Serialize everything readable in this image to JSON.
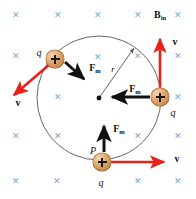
{
  "figure": {
    "field_label": "B",
    "field_subscript": "in",
    "radius_label": "r",
    "point_label": "P",
    "charge_label": "q",
    "force_label": "F",
    "force_subscript": "m",
    "velocity_label": "v",
    "colors": {
      "field_x": "#7ba7d7",
      "velocity_arrow": "#e8211a",
      "force_arrow": "#111111",
      "circle_stroke": "#555555",
      "radius_stroke": "#555555",
      "charge_fill": "#d79c62",
      "background": "#ffffff"
    }
  },
  "geometry": {
    "circle": {
      "cx": 99,
      "cy": 98,
      "r": 62
    },
    "center_dot": {
      "x": 99,
      "y": 98,
      "r": 2.4
    }
  },
  "field_marks": [
    {
      "x": 16,
      "y": 15
    },
    {
      "x": 58,
      "y": 15
    },
    {
      "x": 98,
      "y": 15
    },
    {
      "x": 138,
      "y": 15
    },
    {
      "x": 178,
      "y": 15
    },
    {
      "x": 16,
      "y": 56
    },
    {
      "x": 98,
      "y": 57
    },
    {
      "x": 138,
      "y": 56
    },
    {
      "x": 178,
      "y": 56
    },
    {
      "x": 58,
      "y": 97
    },
    {
      "x": 178,
      "y": 97
    },
    {
      "x": 16,
      "y": 136
    },
    {
      "x": 58,
      "y": 136
    },
    {
      "x": 138,
      "y": 136
    },
    {
      "x": 178,
      "y": 136
    },
    {
      "x": 16,
      "y": 181
    },
    {
      "x": 57,
      "y": 181
    },
    {
      "x": 138,
      "y": 181
    },
    {
      "x": 178,
      "y": 181
    }
  ],
  "charges": [
    {
      "id": "charge-top-left",
      "x": 55,
      "y": 59
    },
    {
      "id": "charge-right",
      "x": 160,
      "y": 97
    },
    {
      "id": "charge-bottom",
      "x": 102,
      "y": 162
    }
  ],
  "arrows": {
    "velocity": [
      {
        "id": "velocity-top-left",
        "x1": 50,
        "y1": 64,
        "x2": 12,
        "y2": 97
      },
      {
        "id": "velocity-right",
        "x1": 160,
        "y1": 90,
        "x2": 160,
        "y2": 36
      },
      {
        "id": "velocity-bottom",
        "x1": 110,
        "y1": 162,
        "x2": 166,
        "y2": 162
      }
    ],
    "force": [
      {
        "id": "force-top-left",
        "x1": 65,
        "y1": 62,
        "x2": 85,
        "y2": 80
      },
      {
        "id": "force-right",
        "x1": 150,
        "y1": 97,
        "x2": 110,
        "y2": 97
      },
      {
        "id": "force-bottom",
        "x1": 104,
        "y1": 152,
        "x2": 104,
        "y2": 123
      }
    ],
    "radius": {
      "x1": 99,
      "y1": 98,
      "x2": 136,
      "y2": 46
    }
  },
  "labels": {
    "field": {
      "x": 160,
      "y": 14
    },
    "radius": {
      "x": 113,
      "y": 69
    },
    "point_p": {
      "x": 93,
      "y": 150
    },
    "q_top_left": {
      "x": 39,
      "y": 52
    },
    "q_right": {
      "x": 173,
      "y": 112
    },
    "q_bottom": {
      "x": 101,
      "y": 182
    },
    "fm_top_left": {
      "x": 95,
      "y": 67
    },
    "fm_right": {
      "x": 135,
      "y": 88
    },
    "fm_bottom": {
      "x": 119,
      "y": 128
    },
    "v_top_left": {
      "x": 18,
      "y": 102
    },
    "v_right": {
      "x": 175,
      "y": 41
    },
    "v_bottom": {
      "x": 177,
      "y": 158
    }
  }
}
